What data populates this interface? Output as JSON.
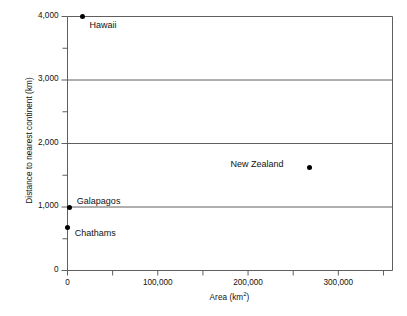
{
  "chart_data": {
    "type": "scatter",
    "title": "",
    "xlabel": "Area (km²)",
    "ylabel": "Distance to nearest continent (km)",
    "xlim": [
      0,
      360000
    ],
    "ylim": [
      0,
      4000
    ],
    "grid": "horizontal-major",
    "legend": "none",
    "x_major_ticks": [
      0,
      100000,
      200000,
      300000
    ],
    "x_major_tick_labels": [
      "0",
      "100,000",
      "200,000",
      "300,000"
    ],
    "x_minor_ticks": [
      50000,
      150000,
      250000,
      350000
    ],
    "y_major_ticks": [
      0,
      1000,
      2000,
      3000,
      4000
    ],
    "y_major_tick_labels": [
      "0",
      "1,000",
      "2,000",
      "3,000",
      "4,000"
    ],
    "y_minor_ticks": [
      500,
      1500,
      2500,
      3500
    ],
    "points": [
      {
        "label": "Hawaii",
        "x": 16600,
        "y": 4000,
        "label_dx": 7,
        "label_dy": 8
      },
      {
        "label": "New Zealand",
        "x": 268000,
        "y": 1620,
        "label_dx": -79,
        "label_dy": -4
      },
      {
        "label": "Galapagos",
        "x": 2600,
        "y": 1000,
        "label_dx": 7,
        "label_dy": -6
      },
      {
        "label": "Chathams",
        "x": 300,
        "y": 680,
        "label_dx": 7,
        "label_dy": 6
      }
    ]
  }
}
